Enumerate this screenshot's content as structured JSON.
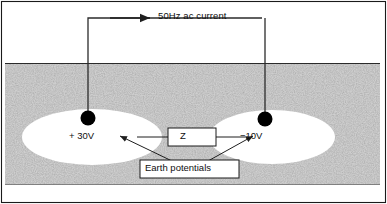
{
  "figure": {
    "frame": {
      "stroke": "#1a1a1a"
    },
    "ground": {
      "name": "earth-soil-region",
      "fill_pattern": "stipple-noise",
      "base_color": "#9b9b9b"
    },
    "circuit": {
      "current_label": "50Hz ac current",
      "wire_color": "#2b2b2b",
      "arrow_direction": "right"
    },
    "electrodes": [
      {
        "name": "left-electrode",
        "voltage_label": "+ 30V",
        "polarity": "positive",
        "color": "#000000"
      },
      {
        "name": "right-electrode",
        "voltage_label": "−10V",
        "polarity": "negative",
        "color": "#000000"
      }
    ],
    "impedance": {
      "label": "Z",
      "box_fill": "#ffffff",
      "box_stroke": "#1a1a1a"
    },
    "annotation": {
      "label": "Earth potentials",
      "box_fill": "#ffffff",
      "box_stroke": "#1a1a1a",
      "pointer_count": 2
    },
    "potential_zones": [
      {
        "name": "left-equipotential-ellipse",
        "fill": "#ffffff"
      },
      {
        "name": "right-equipotential-ellipse",
        "fill": "#ffffff"
      }
    ]
  }
}
